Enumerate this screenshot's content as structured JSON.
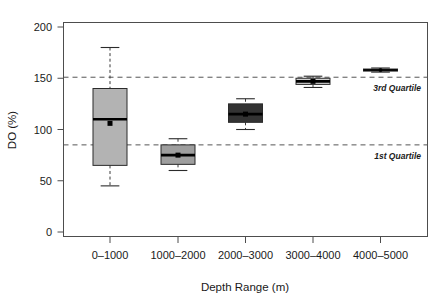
{
  "chart_data": {
    "type": "box",
    "title": "",
    "xlabel": "Depth Range (m)",
    "ylabel": "DO (%)",
    "categories": [
      "0–1000",
      "1000–2000",
      "2000–3000",
      "3000–4000",
      "4000–5000"
    ],
    "ylim": [
      0,
      200
    ],
    "yticks": [
      0,
      50,
      100,
      150,
      200
    ],
    "ytick_labels": [
      "0",
      "50",
      "100",
      "150",
      "200"
    ],
    "grid": false,
    "legend": "none",
    "reference_lines": [
      {
        "label": "3rd Quartile",
        "value": 151,
        "style": "dashed"
      },
      {
        "label": "1st Quartile",
        "value": 85,
        "style": "dashed"
      }
    ],
    "boxes": [
      {
        "category": "0–1000",
        "whisker_low": 45,
        "q1": 65,
        "median": 110,
        "mean": 106,
        "q3": 140,
        "whisker_high": 180,
        "fill": "#b3b3b3",
        "width_units": 34
      },
      {
        "category": "1000–2000",
        "whisker_low": 60,
        "q1": 66,
        "median": 75,
        "mean": 75,
        "q3": 85,
        "whisker_high": 91,
        "fill": "#9e9e9e",
        "width_units": 34
      },
      {
        "category": "2000–3000",
        "whisker_low": 100,
        "q1": 107,
        "median": 115,
        "mean": 115,
        "q3": 125,
        "whisker_high": 130,
        "fill": "#333333",
        "width_units": 34
      },
      {
        "category": "3000–4000",
        "whisker_low": 141,
        "q1": 144,
        "median": 147,
        "mean": 147,
        "q3": 150,
        "whisker_high": 152,
        "fill": "#d0d0d0",
        "width_units": 34
      },
      {
        "category": "4000–5000",
        "whisker_low": 156,
        "q1": 157,
        "median": 158,
        "mean": 158,
        "q3": 159,
        "whisker_high": 160,
        "fill": "#2e2e2e",
        "width_units": 34
      }
    ]
  },
  "colors": {
    "axis": "#4d4d4d",
    "refline": "#555555",
    "text": "#1a1a1a",
    "background": "#ffffff"
  }
}
